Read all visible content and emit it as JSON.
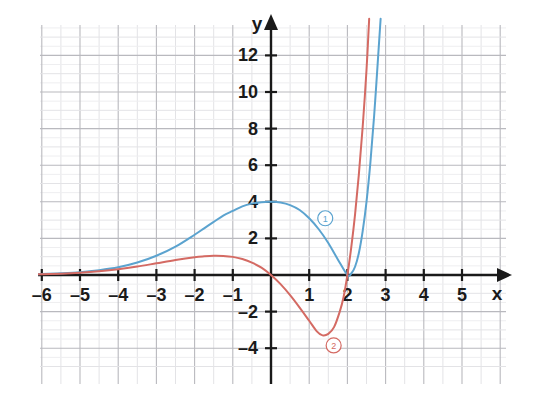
{
  "chart_data": {
    "type": "line",
    "title": "",
    "xlabel": "x",
    "ylabel": "y",
    "xlim": [
      -6.5,
      6.1
    ],
    "ylim": [
      -5.2,
      13.6
    ],
    "grid": true,
    "grid_major_step_x": 1,
    "grid_minor_step_x": 0.5,
    "grid_major_step_y": 1,
    "legend": "inline-numbered-badges",
    "x_ticks": [
      -6,
      -5,
      -4,
      -3,
      -2,
      -1,
      1,
      2,
      3,
      4,
      5
    ],
    "x_tick_labels": [
      "–6",
      "–5",
      "–4",
      "–3",
      "–2",
      "–1",
      "1",
      "2",
      "3",
      "4",
      "5"
    ],
    "y_ticks": [
      -4,
      -2,
      2,
      4,
      6,
      8,
      10,
      12
    ],
    "y_tick_labels": [
      "–4",
      "–2",
      "2",
      "4",
      "6",
      "8",
      "10",
      "12"
    ],
    "series": [
      {
        "name": "1",
        "badge_label": "1",
        "color": "#5ba3cf",
        "badge_x": 1.42,
        "badge_y": 3.1,
        "annotation": "curve 1 – blue, local max 4 near x=0.2, touches x-axis at x=2",
        "points": [
          [
            -6.5,
            0.02
          ],
          [
            -6.0,
            0.05
          ],
          [
            -5.5,
            0.09
          ],
          [
            -5.0,
            0.15
          ],
          [
            -4.5,
            0.26
          ],
          [
            -4.0,
            0.42
          ],
          [
            -3.5,
            0.68
          ],
          [
            -3.0,
            1.05
          ],
          [
            -2.5,
            1.55
          ],
          [
            -2.0,
            2.2
          ],
          [
            -1.75,
            2.55
          ],
          [
            -1.5,
            2.9
          ],
          [
            -1.25,
            3.25
          ],
          [
            -1.0,
            3.5
          ],
          [
            -0.75,
            3.75
          ],
          [
            -0.5,
            3.9
          ],
          [
            -0.25,
            3.98
          ],
          [
            0.0,
            4.0
          ],
          [
            0.25,
            3.96
          ],
          [
            0.5,
            3.82
          ],
          [
            0.75,
            3.55
          ],
          [
            1.0,
            3.1
          ],
          [
            1.25,
            2.5
          ],
          [
            1.5,
            1.75
          ],
          [
            1.75,
            0.85
          ],
          [
            2.0,
            0.0
          ],
          [
            2.1,
            0.08
          ],
          [
            2.2,
            0.45
          ],
          [
            2.3,
            1.2
          ],
          [
            2.4,
            2.4
          ],
          [
            2.5,
            4.0
          ],
          [
            2.6,
            6.1
          ],
          [
            2.7,
            8.7
          ],
          [
            2.8,
            11.8
          ],
          [
            2.87,
            14.0
          ]
        ]
      },
      {
        "name": "2",
        "badge_label": "2",
        "color": "#d46a63",
        "badge_x": 1.64,
        "badge_y": -3.85,
        "annotation": "curve 2 – red, local max ~1.05 near x=-1.4, local min ~-3.3 near x=1.35, touches x-axis at x=2",
        "points": [
          [
            -6.5,
            0.02
          ],
          [
            -6.0,
            0.04
          ],
          [
            -5.5,
            0.07
          ],
          [
            -5.0,
            0.12
          ],
          [
            -4.5,
            0.2
          ],
          [
            -4.0,
            0.31
          ],
          [
            -3.5,
            0.46
          ],
          [
            -3.0,
            0.64
          ],
          [
            -2.5,
            0.82
          ],
          [
            -2.0,
            0.97
          ],
          [
            -1.75,
            1.02
          ],
          [
            -1.5,
            1.05
          ],
          [
            -1.25,
            1.04
          ],
          [
            -1.0,
            0.99
          ],
          [
            -0.75,
            0.87
          ],
          [
            -0.5,
            0.68
          ],
          [
            -0.25,
            0.4
          ],
          [
            0.0,
            0.0
          ],
          [
            0.25,
            -0.5
          ],
          [
            0.5,
            -1.1
          ],
          [
            0.75,
            -1.78
          ],
          [
            1.0,
            -2.5
          ],
          [
            1.2,
            -3.08
          ],
          [
            1.35,
            -3.3
          ],
          [
            1.5,
            -3.22
          ],
          [
            1.65,
            -2.85
          ],
          [
            1.8,
            -2.0
          ],
          [
            1.9,
            -1.2
          ],
          [
            2.0,
            0.0
          ],
          [
            2.1,
            1.5
          ],
          [
            2.2,
            3.3
          ],
          [
            2.3,
            5.5
          ],
          [
            2.4,
            8.1
          ],
          [
            2.5,
            11.2
          ],
          [
            2.57,
            14.0
          ]
        ]
      }
    ]
  },
  "axes": {
    "x_axis_label": "x",
    "y_axis_label": "y"
  }
}
